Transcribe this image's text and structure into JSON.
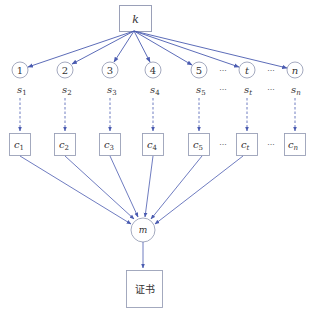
{
  "diagram": {
    "colors": {
      "edge": "#4a5bb0",
      "node_border": "#9aa0b8",
      "text": "#333333",
      "background": "#ffffff"
    },
    "source": {
      "label": "k",
      "shape": "rect"
    },
    "shares": [
      {
        "index_label": "1",
        "secret_label": "s",
        "secret_sub": "1",
        "cipher_label": "c",
        "cipher_sub": "1",
        "to_m": true
      },
      {
        "index_label": "2",
        "secret_label": "s",
        "secret_sub": "2",
        "cipher_label": "c",
        "cipher_sub": "2",
        "to_m": true
      },
      {
        "index_label": "3",
        "secret_label": "s",
        "secret_sub": "3",
        "cipher_label": "c",
        "cipher_sub": "3",
        "to_m": true
      },
      {
        "index_label": "4",
        "secret_label": "s",
        "secret_sub": "4",
        "cipher_label": "c",
        "cipher_sub": "4",
        "to_m": true
      },
      {
        "index_label": "5",
        "secret_label": "s",
        "secret_sub": "5",
        "cipher_label": "c",
        "cipher_sub": "5",
        "to_m": true
      },
      {
        "index_label": "t",
        "secret_label": "s",
        "secret_sub": "t",
        "cipher_label": "c",
        "cipher_sub": "t",
        "to_m": true
      },
      {
        "index_label": "n",
        "secret_label": "s",
        "secret_sub": "n",
        "cipher_label": "c",
        "cipher_sub": "n",
        "to_m": false
      }
    ],
    "ellipsis": "···",
    "combiner": {
      "label": "m",
      "shape": "circle"
    },
    "output": {
      "label": "证书",
      "shape": "rect"
    }
  }
}
